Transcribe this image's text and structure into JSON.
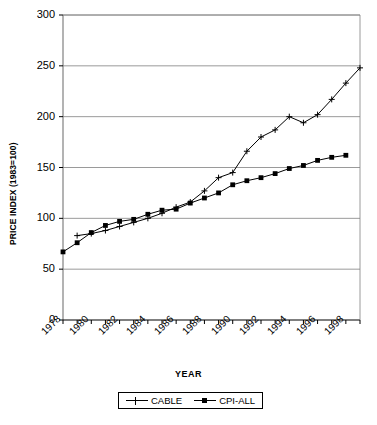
{
  "chart_data": {
    "type": "line",
    "title": "",
    "xlabel": "YEAR",
    "ylabel": "PRICE INDEX (1983=100)",
    "xlim": [
      1978,
      1999
    ],
    "ylim": [
      0,
      300
    ],
    "yticks": [
      0,
      50,
      100,
      150,
      200,
      250,
      300
    ],
    "xticks": [
      1978,
      1979,
      1980,
      1981,
      1982,
      1983,
      1984,
      1985,
      1986,
      1987,
      1988,
      1989,
      1990,
      1991,
      1992,
      1993,
      1994,
      1995,
      1996,
      1997,
      1998,
      1999
    ],
    "xtick_labels": [
      "1978",
      "",
      "1980",
      "",
      "1982",
      "",
      "1984",
      "",
      "1986",
      "",
      "1988",
      "",
      "1990",
      "",
      "1992",
      "",
      "1994",
      "",
      "1996",
      "",
      "1998",
      ""
    ],
    "grid": "horizontal",
    "legend_position": "bottom-center",
    "x": [
      1978,
      1979,
      1980,
      1981,
      1982,
      1983,
      1984,
      1985,
      1986,
      1987,
      1988,
      1989,
      1990,
      1991,
      1992,
      1993,
      1994,
      1995,
      1996,
      1997,
      1998,
      1999
    ],
    "series": [
      {
        "name": "CABLE",
        "marker": "plus",
        "values": [
          null,
          83,
          85,
          88,
          92,
          96,
          100,
          105,
          111,
          116,
          127,
          140,
          145,
          166,
          180,
          187,
          200,
          194,
          202,
          217,
          233,
          248
        ]
      },
      {
        "name": "CPI-ALL",
        "marker": "square",
        "values": [
          67,
          76,
          86,
          93,
          97,
          99,
          104,
          108,
          109,
          115,
          120,
          125,
          133,
          137,
          140,
          144,
          149,
          152,
          157,
          160,
          162,
          null
        ]
      }
    ]
  },
  "legend": {
    "entries": [
      {
        "label": "CABLE"
      },
      {
        "label": "CPI-ALL"
      }
    ]
  },
  "colors": {
    "line": "#000000",
    "grid": "#808080",
    "axis": "#808080",
    "background": "#ffffff"
  }
}
